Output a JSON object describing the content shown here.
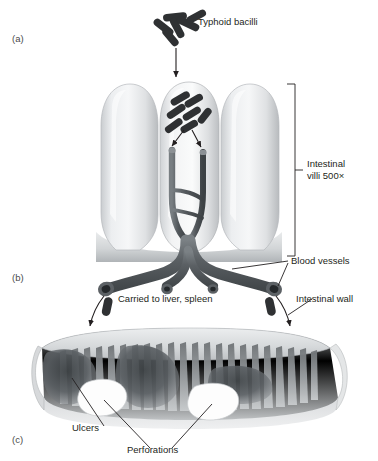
{
  "figure": {
    "type": "three-panel grayscale medical illustration"
  },
  "panels": [
    {
      "id": "a",
      "label": "(a)",
      "x": 12,
      "y": 33
    },
    {
      "id": "b",
      "label": "(b)",
      "x": 12,
      "y": 272
    },
    {
      "id": "c",
      "label": "(c)",
      "x": 12,
      "y": 434
    }
  ],
  "labels": {
    "typhoid_bacilli": "Typhoid bacilli",
    "intestinal_villi": "Intestinal\nvilli 500×",
    "intestinal_villi_line1": "Intestinal",
    "intestinal_villi_line2": "villi 500×",
    "blood_vessels": "Blood vessels",
    "carried_to_liver_spleen": "Carried to liver, spleen",
    "intestinal_wall": "Intestinal wall",
    "ulcers": "Ulcers",
    "perforations": "Perforations"
  },
  "colors": {
    "ink": "#231f20",
    "bacilli": "#2f3133",
    "villi_light": "#f0f1f2",
    "villi_mid": "#d8dadc",
    "villi_shadow": "#b9bcbf",
    "vessel_dark": "#4e5356",
    "vessel_mid": "#6e7478",
    "wall_light": "#e3e5e6",
    "wall_mid": "#b5b8ba",
    "wall_fold": "#8d9194",
    "ulcer_dark": "#54585b",
    "perforation": "#fdfdfd",
    "background": "#ffffff"
  },
  "diagram_content": {
    "panel_a": {
      "description": "Three intestinal villi in cross-section; typhoid bacilli cluster above, arrow points down into the central villus where bacilli enter capillaries",
      "bacilli_count_top": 6,
      "bacilli_count_inside_villus": 7,
      "villi_count": 3,
      "magnification": "500×",
      "capillaries": 2,
      "entry_arrows": 2
    },
    "panel_b": {
      "description": "Branching blood vessels at the base of the villi with cut open ends; bacilli carried away by curved arrows to liver and spleen",
      "vessel_branches": 4,
      "cut_ends": 4,
      "escaping_bacilli": 2,
      "escape_arrows": 2
    },
    "panel_c": {
      "description": "Cut-away cylindrical segment of intestinal wall showing ridged mucosal folds, dark ulcerated patches and two white perforations",
      "ulcer_patches": 3,
      "perforations": 2,
      "fold_count": 26
    }
  }
}
